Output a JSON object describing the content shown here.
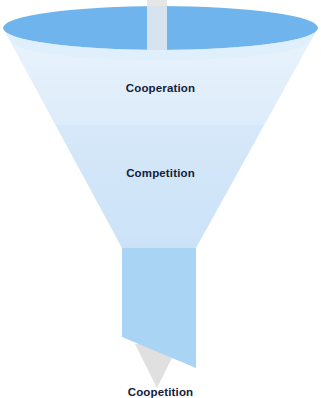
{
  "diagram": {
    "type": "funnel",
    "background_color": "#ffffff",
    "funnel": {
      "rim_color": "#6fb4ec",
      "band_top_color": "#e4f0fb",
      "band_middle_color": "#d3e6f9",
      "band_lower_color": "#cfe4f8",
      "spout_color": "#a9d4f4"
    },
    "arrow": {
      "name": "down-arrow",
      "color": "#e3e3e3",
      "direction": "down"
    },
    "stages": [
      {
        "id": "cooperation",
        "label": "Cooperation"
      },
      {
        "id": "competition",
        "label": "Competition"
      }
    ],
    "outcome": {
      "id": "coopetition",
      "label": "Coopetition"
    }
  }
}
